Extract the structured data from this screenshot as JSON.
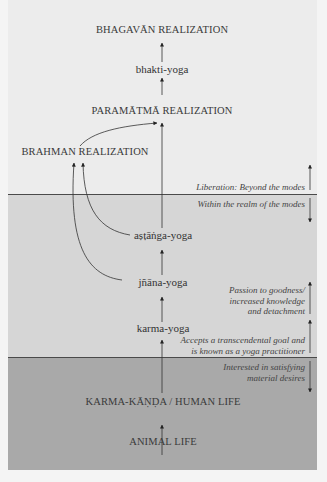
{
  "diagram": {
    "stages": {
      "bhagavan": "BHAGAVĀN REALIZATION",
      "bhakti": "bhakti-yoga",
      "paramatma": "PARAMĀTMĀ REALIZATION",
      "brahman": "BRAHMAN REALIZATION",
      "astanga": "aṣṭāṅga-yoga",
      "jnana": "jñāna-yoga",
      "karma": "karma-yoga",
      "karma_kanda": "KARMA-KĀṆḌA / HUMAN LIFE",
      "animal": "ANIMAL LIFE"
    },
    "notes": {
      "liberation": "Liberation: Beyond the modes",
      "within_modes": "Within the realm of the modes",
      "passion_line1": "Passion to goodness/",
      "passion_line2": "increased knowledge",
      "passion_line3": "and detachment",
      "accepts_line1": "Accepts a transcendental goal and",
      "accepts_line2": "is known as a yoga practitioner",
      "interested_line1": "Interested in satisfying",
      "interested_line2": "material desires"
    },
    "bands": {
      "top_color": "#ececec",
      "middle_color": "#d6d6d6",
      "bottom_color": "#a9a9a9",
      "line_color": "#4a4a4a"
    }
  }
}
